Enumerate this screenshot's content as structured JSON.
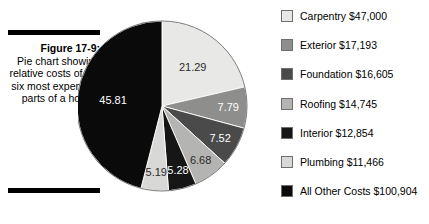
{
  "figure": {
    "number_label": "Figure 17-9:",
    "caption": "Pie chart showing relative costs of the six most expensive parts of a house."
  },
  "chart_data": {
    "type": "pie",
    "title": "",
    "start_angle_deg": 0,
    "direction": "clockwise",
    "legend_position": "right",
    "grid": false,
    "value_unit": "percent",
    "categories": [
      "Carpentry",
      "Exterior",
      "Foundation",
      "Roofing",
      "Interior",
      "Plumbing",
      "All Other Costs"
    ],
    "values": [
      21.29,
      7.79,
      7.52,
      6.68,
      5.28,
      5.19,
      45.81
    ],
    "slice_labels": [
      "21.29",
      "7.79",
      "7.52",
      "6.68",
      "5.28",
      "5.19",
      "45.81"
    ],
    "amounts": [
      "$47,000",
      "$17,193",
      "$16,605",
      "$14,745",
      "$12,854",
      "$11,466",
      "$100,904"
    ],
    "colors": [
      "#e8e8e6",
      "#8e8e8c",
      "#4a4a4a",
      "#b4b4b2",
      "#161616",
      "#d8d8d6",
      "#0a0a0a"
    ],
    "label_text_colors": [
      "#2b2b2b",
      "#ffffff",
      "#ffffff",
      "#2b2b2b",
      "#ffffff",
      "#2b2b2b",
      "#ffffff"
    ]
  },
  "legend": {
    "items": [
      {
        "label": "Carpentry $47,000",
        "color": "#e8e8e6"
      },
      {
        "label": "Exterior $17,193",
        "color": "#8e8e8c"
      },
      {
        "label": "Foundation $16,605",
        "color": "#4a4a4a"
      },
      {
        "label": "Roofing $14,745",
        "color": "#b4b4b2"
      },
      {
        "label": "Interior $12,854",
        "color": "#161616"
      },
      {
        "label": "Plumbing $11,466",
        "color": "#d8d8d6"
      },
      {
        "label": "All Other Costs $100,904",
        "color": "#0a0a0a"
      }
    ]
  }
}
